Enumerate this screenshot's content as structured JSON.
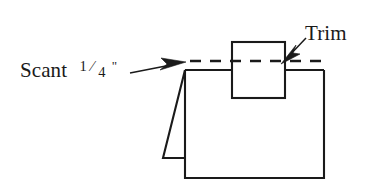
{
  "figure": {
    "background_color": "#ffffff",
    "line_color": "#1a1a1a",
    "width": 378,
    "height": 185
  },
  "labels": {
    "scant": {
      "text_prefix": "Scant",
      "fraction_numerator": "1",
      "fraction_denominator": "4",
      "unit_mark": "\"",
      "full_text": "Scant 1/4\"",
      "x": 20,
      "y": 77
    },
    "trim": {
      "text": "Trim",
      "x": 305,
      "y": 40
    }
  },
  "shapes": {
    "main_body": {
      "name": "main-panel",
      "points": "185,70 185,178 324,178 324,70"
    },
    "left_flap": {
      "name": "folded-flap",
      "points": "185,70 163,158 184,158"
    },
    "trim_box": {
      "name": "trim-block",
      "x": 232,
      "y": 42,
      "width": 53,
      "height": 56
    },
    "top_left_segment": {
      "name": "top-edge-left",
      "points": "185,70 232,70"
    },
    "top_right_segment": {
      "name": "top-edge-right",
      "points": "285,70 324,70"
    }
  },
  "dashed_trim_line": {
    "name": "trim-guide-line",
    "x1": 190,
    "y1": 61,
    "x2": 327,
    "y2": 61,
    "dash_pattern": "11 9"
  },
  "arrows": {
    "scant_arrow": {
      "name": "scant-leader",
      "tail_x": 130,
      "tail_y": 73,
      "tip_x": 186,
      "tip_y": 62,
      "direction": "right"
    },
    "trim_arrow": {
      "name": "trim-leader",
      "tail_x": 306,
      "tail_y": 38,
      "tip_x": 281,
      "tip_y": 64,
      "direction": "down-left"
    }
  }
}
